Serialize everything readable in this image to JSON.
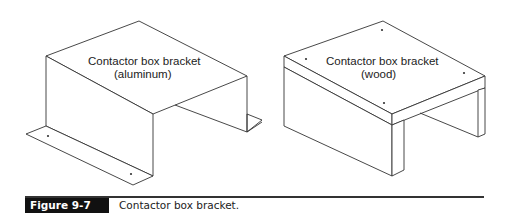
{
  "figure": {
    "number_label": "Figure 9-7",
    "caption": "Contactor box bracket."
  },
  "drawings": [
    {
      "id": "aluminum-bracket",
      "label_line1": "Contactor box bracket",
      "label_line2": "(aluminum)"
    },
    {
      "id": "wood-bracket",
      "label_line1": "Contactor box bracket",
      "label_line2": "(wood)"
    }
  ],
  "colors": {
    "line": "#333333",
    "tag_background": "#111111",
    "tag_text": "#ffffff"
  }
}
